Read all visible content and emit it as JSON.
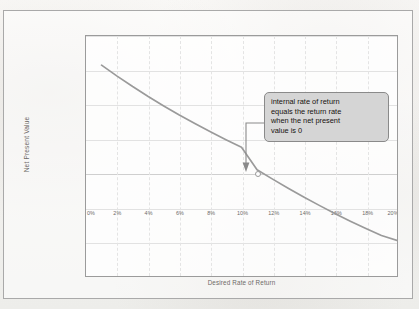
{
  "chart_data": {
    "type": "line",
    "title": "",
    "xlabel": "Desired Rate of Return",
    "ylabel": "Net Present Value",
    "xlim": [
      0,
      20
    ],
    "ylim": [
      -60000,
      80000
    ],
    "grid": true,
    "legend": null,
    "x_tick_labels": [
      "0%",
      "2%",
      "4%",
      "6%",
      "8%",
      "10%",
      "12%",
      "14%",
      "16%",
      "18%",
      "20%"
    ],
    "x_tick_values": [
      0,
      2,
      4,
      6,
      8,
      10,
      12,
      14,
      16,
      18,
      20
    ],
    "y_tick_labels": [
      "$80,000.00",
      "$60,000.00",
      "$40,000.00",
      "$20,000.00",
      "$-",
      "$(20,000.00)",
      "$(40,000.00)",
      "$(60,000.00)"
    ],
    "y_tick_values": [
      80000,
      60000,
      40000,
      20000,
      0,
      -20000,
      -40000,
      -60000
    ],
    "series": [
      {
        "name": "Net Present Value",
        "color": "#9a9a9a",
        "x": [
          1,
          2,
          3,
          4,
          5,
          6,
          7,
          8,
          9,
          10,
          11,
          12,
          13,
          14,
          15,
          16,
          17,
          18,
          19,
          20
        ],
        "values": [
          63000,
          56600,
          50500,
          44700,
          39200,
          33900,
          28900,
          24100,
          19500,
          15100,
          2000,
          -3500,
          -8800,
          -13900,
          -18800,
          -23500,
          -28000,
          -32300,
          -36400,
          -39200
        ]
      }
    ],
    "annotations": [
      {
        "name": "irr-callout",
        "text_lines": [
          "internal rate of return",
          "equals the return rate",
          "when the net present",
          "value is 0"
        ],
        "points_to_x": 11,
        "points_to_y": 0,
        "box_fill": "#d5d5d5",
        "box_border": "#8a8a8a"
      }
    ]
  },
  "axes": {
    "y_title": "Net Present Value",
    "x_title": "Desired Rate of Return"
  },
  "colors": {
    "page_background": "#f4f3f1",
    "plot_border": "#9b9b9b",
    "grid": "#e2e2e2",
    "curve": "#9a9a9a",
    "text": "#6d6a67",
    "callout_text": "#15130f"
  }
}
